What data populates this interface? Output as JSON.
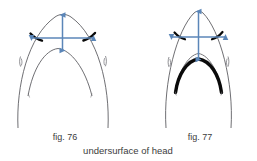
{
  "plate": {
    "title": "undersurface of head",
    "figures": [
      {
        "id": "fig-76",
        "label": "fig. 76",
        "description": "undersurface of head - broad rounded snout form",
        "outer_snout": "broad parabola",
        "inner_mouth": "broad parabola",
        "mouth_arc_weight": "thin",
        "corner_marks": "two thick black crescents at mouth corners",
        "spiracles": 2,
        "arrows": {
          "vertical": {
            "label": "",
            "style": "double-headed",
            "orientation": "vertical",
            "length_px": 36
          },
          "horizontal": {
            "label": "",
            "style": "double-headed",
            "orientation": "horizontal",
            "length_px": 62
          }
        }
      },
      {
        "id": "fig-77",
        "label": "fig. 77",
        "description": "undersurface of head - narrow pointed snout form",
        "outer_snout": "narrow pointed parabola",
        "inner_mouth": "narrow parabola",
        "mouth_arc_weight": "thick black",
        "corner_marks": "two thick black crescents at mouth corners",
        "spiracles": 2,
        "arrows": {
          "vertical": {
            "label": "",
            "style": "double-headed",
            "orientation": "vertical",
            "length_px": 50
          },
          "horizontal": {
            "label": "",
            "style": "double-headed",
            "orientation": "horizontal",
            "length_px": 54
          }
        }
      }
    ]
  },
  "colors": {
    "arrow_blue": "#5b86b8",
    "outline_gray": "#55555a",
    "thick_black": "#0a0a0a",
    "text_gray": "#3c3c3c",
    "background": "#ffffff"
  }
}
